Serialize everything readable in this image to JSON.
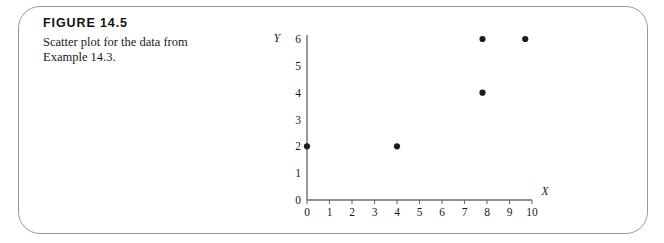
{
  "figure": {
    "number_label": "FIGURE 14.5",
    "caption": "Scatter plot for the data from Example 14.3."
  },
  "chart_data": {
    "type": "scatter",
    "title": "",
    "xlabel": "X",
    "ylabel": "Y",
    "xlim": [
      0,
      10
    ],
    "ylim": [
      0,
      6
    ],
    "xticks": [
      "0",
      "1",
      "2",
      "3",
      "4",
      "5",
      "6",
      "7",
      "8",
      "9",
      "10"
    ],
    "yticks": [
      "0",
      "1",
      "2",
      "3",
      "4",
      "5",
      "6"
    ],
    "grid": false,
    "legend": null,
    "points": [
      {
        "x": 0.0,
        "y": 2
      },
      {
        "x": 4.0,
        "y": 2
      },
      {
        "x": 7.8,
        "y": 4
      },
      {
        "x": 7.8,
        "y": 6
      },
      {
        "x": 9.7,
        "y": 6
      }
    ],
    "marker": "filled-circle",
    "marker_color": "#1c1c1c"
  },
  "style": {
    "card_border_color": "#9a9a9a",
    "axis_color": "#6b6b6b",
    "text_color": "#1a1a1a"
  }
}
